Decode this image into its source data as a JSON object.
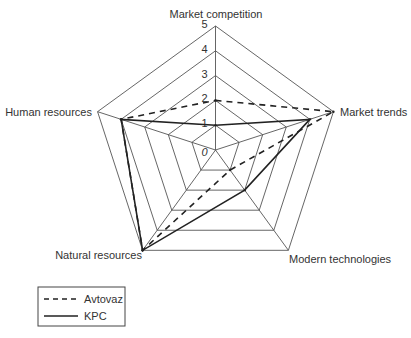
{
  "chart_data": {
    "type": "radar",
    "title": "",
    "axes": [
      "Market competition",
      "Market trends",
      "Modern technologies",
      "Natural resources",
      "Human resources"
    ],
    "range": [
      0,
      5
    ],
    "ticks": [
      "0",
      "1",
      "2",
      "3",
      "4",
      "5"
    ],
    "grid": true,
    "legend_position": "bottom-left",
    "series": [
      {
        "name": "Avtovaz",
        "style": "dashed",
        "color": "#222222",
        "values": [
          2,
          5,
          1,
          5,
          4
        ]
      },
      {
        "name": "KPC",
        "style": "solid",
        "color": "#222222",
        "values": [
          1,
          4,
          2,
          5,
          4
        ]
      }
    ]
  }
}
